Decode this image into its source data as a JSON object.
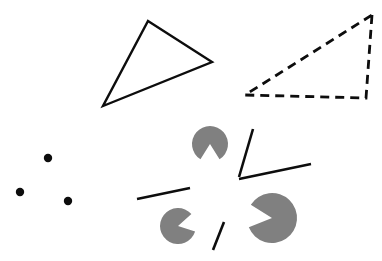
{
  "figure": {
    "canvas": {
      "width": 382,
      "height": 261,
      "background": "#ffffff"
    },
    "colors": {
      "stroke": "#0d0d0d",
      "wedge_fill": "#808080",
      "dot_fill": "#0d0d0d",
      "background": "#ffffff"
    },
    "shapes": {
      "solid_triangle": {
        "name": "solid-outline-triangle",
        "points": "148,21 212,62 103,106",
        "stroke_width": 2.4,
        "dash": "none"
      },
      "dashed_triangle": {
        "name": "dashed-outline-triangle",
        "points": "372,15 366,98 245,95",
        "stroke_width": 2.8,
        "dash": "9,6"
      },
      "dots": [
        {
          "name": "dot-upper",
          "cx": 48,
          "cy": 158,
          "r": 4.2
        },
        {
          "name": "dot-left",
          "cx": 20,
          "cy": 192,
          "r": 4.2
        },
        {
          "name": "dot-lower",
          "cx": 68,
          "cy": 201,
          "r": 4.2
        }
      ],
      "wedges": [
        {
          "name": "wedge-top",
          "cx": 210,
          "cy": 144,
          "r": 18,
          "notch_start_deg": 58,
          "notch_end_deg": 122
        },
        {
          "name": "wedge-bottom-left",
          "cx": 178,
          "cy": 226,
          "r": 18,
          "notch_start_deg": 318,
          "notch_end_deg": 18
        },
        {
          "name": "wedge-bottom-right",
          "cx": 272,
          "cy": 218,
          "r": 25,
          "notch_start_deg": 158,
          "notch_end_deg": 212
        }
      ],
      "segments": [
        {
          "name": "segment-upper-right-diagonal",
          "x1": 253,
          "y1": 129,
          "x2": 239,
          "y2": 177,
          "stroke_width": 2.6
        },
        {
          "name": "segment-lower-right-horizontal",
          "x1": 239,
          "y1": 179,
          "x2": 311,
          "y2": 164,
          "stroke_width": 2.6
        },
        {
          "name": "segment-left-horizontal",
          "x1": 137,
          "y1": 199,
          "x2": 190,
          "y2": 188,
          "stroke_width": 2.6
        },
        {
          "name": "segment-bottom-short-diagonal",
          "x1": 224,
          "y1": 222,
          "x2": 213,
          "y2": 250,
          "stroke_width": 2.6
        }
      ]
    }
  }
}
